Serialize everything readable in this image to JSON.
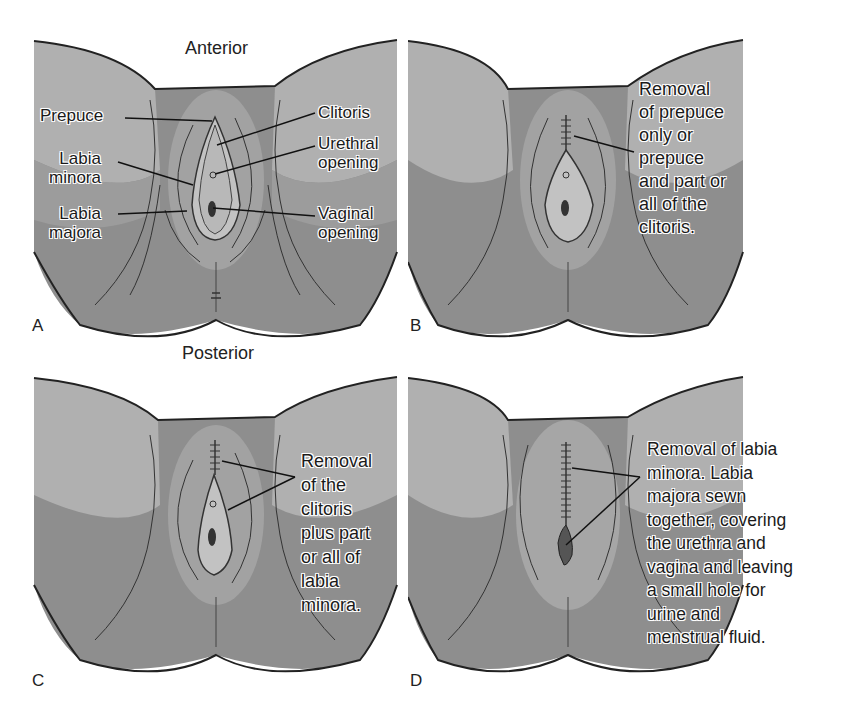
{
  "headings": {
    "anterior": "Anterior",
    "posterior": "Posterior"
  },
  "panels": [
    {
      "letter": "A",
      "labels": [
        {
          "id": "prepuce",
          "text": "Prepuce"
        },
        {
          "id": "labia_minora",
          "text": "Labia\nminora"
        },
        {
          "id": "labia_majora",
          "text": "Labia\nmajora"
        },
        {
          "id": "clitoris",
          "text": "Clitoris"
        },
        {
          "id": "urethral_opening",
          "text": "Urethral\nopening"
        },
        {
          "id": "vaginal_opening",
          "text": "Vaginal\nopening"
        }
      ]
    },
    {
      "letter": "B",
      "caption": "Removal\nof prepuce\nonly or\nprepuce\nand part or\nall of the\nclitoris."
    },
    {
      "letter": "C",
      "caption": "Removal\nof the\nclitoris\nplus part\nor all of\nlabia\nminora."
    },
    {
      "letter": "D",
      "caption": "Removal of labia\nminora. Labia\nmajora sewn\ntogether, covering\nthe urethra and\nvagina and leaving\na small hole for\nurine and\nmenstrual fluid."
    }
  ],
  "colors": {
    "skin_dark": "#8a8a8a",
    "skin_mid": "#9a9a9a",
    "skin_light": "#b4b4b4",
    "inner": "#a8a8a8",
    "vulva": "#bdbdbd",
    "outline": "#222222"
  }
}
